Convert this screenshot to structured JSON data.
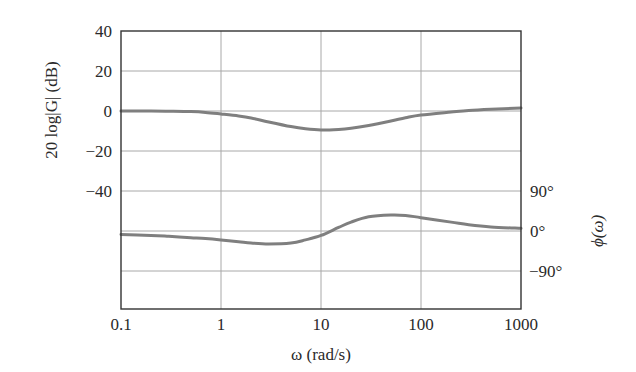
{
  "chart_data": {
    "type": "line",
    "title": "",
    "xlabel": "ω (rad/s)",
    "ylabel_left": "20 log|G| (dB)",
    "ylabel_right": "ϕ(ω)",
    "x_scale": "log",
    "xlim": [
      0.1,
      1000
    ],
    "x_ticks": [
      "0.1",
      "1",
      "10",
      "100",
      "1000"
    ],
    "x_tick_values": [
      0.1,
      1,
      10,
      100,
      1000
    ],
    "left_axis": {
      "ticks": [
        "40",
        "20",
        "0",
        "−20",
        "−40"
      ],
      "tick_values": [
        40,
        20,
        0,
        -20,
        -40
      ],
      "ylim": [
        -100,
        40
      ],
      "unit": "dB"
    },
    "right_axis": {
      "ticks": [
        "90°",
        "0°",
        "−90°"
      ],
      "tick_values": [
        90,
        0,
        -90
      ],
      "ylim": [
        -180,
        160
      ],
      "unit": "deg"
    },
    "grid": true,
    "legend": null,
    "series": [
      {
        "name": "magnitude",
        "axis": "left",
        "unit": "dB",
        "x": [
          0.1,
          0.2,
          0.3,
          0.5,
          0.7,
          1,
          1.5,
          2,
          3,
          5,
          7,
          10,
          15,
          20,
          30,
          50,
          70,
          100,
          200,
          300,
          500,
          1000
        ],
        "values": [
          0,
          0,
          -0.1,
          -0.3,
          -0.7,
          -1.5,
          -2.5,
          -3.5,
          -5.5,
          -7.8,
          -8.9,
          -9.5,
          -9.2,
          -8.6,
          -7.2,
          -5,
          -3.4,
          -2,
          -0.5,
          0.3,
          0.9,
          1.5
        ]
      },
      {
        "name": "phase",
        "axis": "right",
        "unit": "deg",
        "x": [
          0.1,
          0.2,
          0.3,
          0.5,
          0.7,
          1,
          1.5,
          2,
          3,
          5,
          7,
          10,
          15,
          20,
          30,
          50,
          70,
          100,
          200,
          300,
          500,
          1000
        ],
        "values": [
          -8,
          -10,
          -12,
          -15,
          -17,
          -20,
          -24,
          -27,
          -29,
          -27,
          -20,
          -10,
          8,
          20,
          32,
          36,
          35,
          30,
          20,
          14,
          9,
          6
        ]
      }
    ]
  },
  "labels": {
    "xlabel": "ω (rad/s)",
    "ylabel_left": "20 log|G| (dB)",
    "ylabel_right": "ϕ(ω)"
  },
  "colors": {
    "curve": "#7f7f7f",
    "grid": "#a8a8a8",
    "frame": "#333333"
  }
}
